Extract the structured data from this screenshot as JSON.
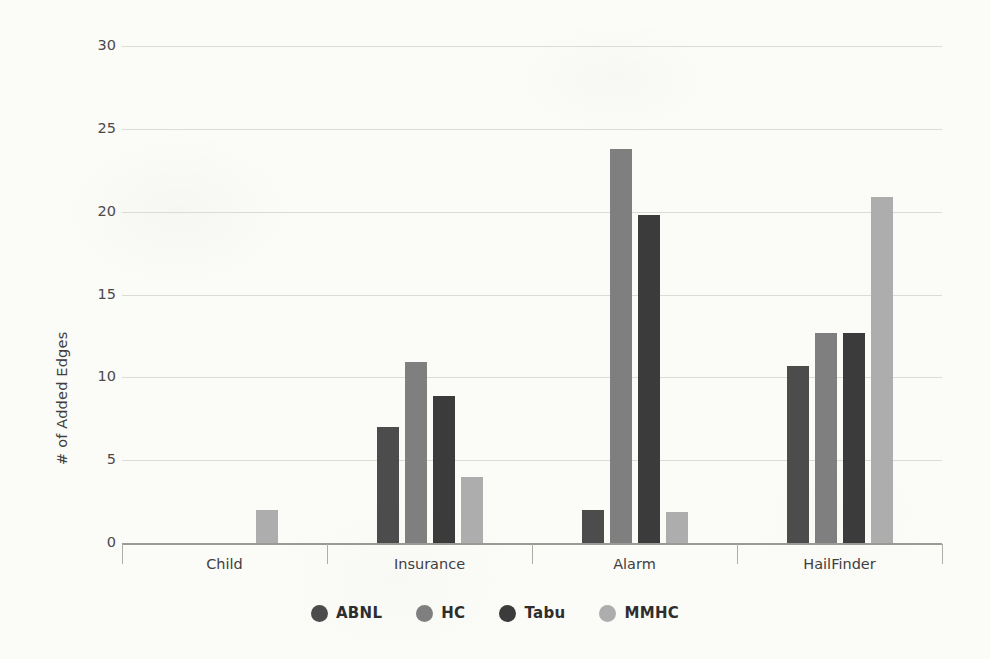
{
  "chart_data": {
    "type": "bar",
    "title": "",
    "subtitle": "",
    "xlabel": "",
    "ylabel": "# of Added Edges",
    "categories": [
      "Child",
      "Insurance",
      "Alarm",
      "HailFinder"
    ],
    "series": [
      {
        "name": "ABNL",
        "color": "#4c4c4c",
        "values": [
          0,
          7.0,
          2.0,
          10.7
        ]
      },
      {
        "name": "HC",
        "color": "#7f7f7f",
        "values": [
          0,
          10.9,
          23.8,
          12.7
        ]
      },
      {
        "name": "Tabu",
        "color": "#3b3b3b",
        "values": [
          0,
          8.9,
          19.8,
          12.7
        ]
      },
      {
        "name": "MMHC",
        "color": "#adadad",
        "values": [
          2.0,
          4.0,
          1.9,
          20.9
        ]
      }
    ],
    "ylim": [
      0,
      30
    ],
    "ytick_values": [
      0,
      5,
      10,
      15,
      20,
      25,
      30
    ],
    "ytick_labels": [
      "0",
      "5",
      "10",
      "15",
      "20",
      "25",
      "30"
    ],
    "grid": true,
    "legend_position": "bottom",
    "legend_marker": "circle"
  },
  "axes": {
    "y_title": "# of Added Edges"
  },
  "legend": {
    "entries": [
      {
        "label": "ABNL",
        "color": "#4c4c4c"
      },
      {
        "label": "HC",
        "color": "#7f7f7f"
      },
      {
        "label": "Tabu",
        "color": "#3b3b3b"
      },
      {
        "label": "MMHC",
        "color": "#adadad"
      }
    ]
  }
}
